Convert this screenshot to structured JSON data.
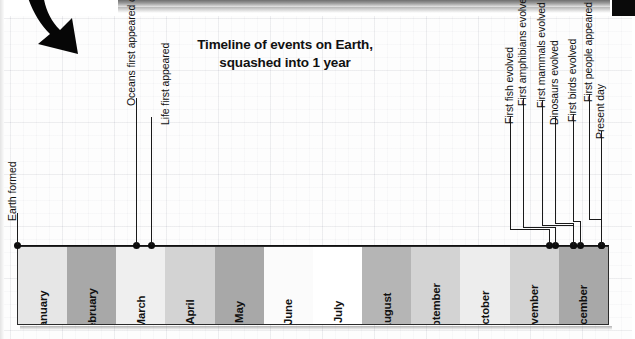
{
  "title": {
    "line1": "Timeline of events on Earth,",
    "line2": "squashed into 1 year"
  },
  "colors": {
    "band_light": "#efefef",
    "band_mid": "#d3d3d3",
    "band_dark": "#a8a8a8",
    "band_white": "#fbfbfb",
    "axis": "#111111",
    "marker": "#0d0d0d"
  },
  "chart_data": {
    "type": "timeline",
    "title": "Timeline of events on Earth, squashed into 1 year",
    "xlabel": "",
    "ylabel": "",
    "axis_range_months": [
      0,
      12
    ],
    "grid": true,
    "legend": "none",
    "categories": [
      "January",
      "February",
      "March",
      "April",
      "May",
      "June",
      "July",
      "August",
      "September",
      "October",
      "November",
      "December"
    ],
    "band_shades": [
      "#e6e6e6",
      "#a8a8a8",
      "#efefef",
      "#d3d3d3",
      "#a8a8a8",
      "#fbfbfb",
      "#ffffff",
      "#b5b5b5",
      "#d3d3d3",
      "#ededed",
      "#d3d3d3",
      "#a8a8a8"
    ],
    "events": [
      {
        "label": "Earth formed",
        "month_value": 0.0
      },
      {
        "label": "Oceans first appeared on Earth",
        "month_value": 2.42
      },
      {
        "label": "Life first appeared",
        "month_value": 2.72
      },
      {
        "label": "First fish evolved",
        "month_value": 10.79
      },
      {
        "label": "First amphibians evolved",
        "month_value": 10.91
      },
      {
        "label": "First mammals evolved",
        "month_value": 11.27
      },
      {
        "label": "Dinosaurs evolved",
        "month_value": 11.41
      },
      {
        "label": "First birds evolved",
        "month_value": 11.68
      },
      {
        "label": "First people appeared on Earth",
        "month_value": 11.98
      },
      {
        "label": "Present day",
        "month_value": 12.0
      }
    ]
  },
  "months": [
    {
      "name": "January",
      "shade": "#e6e6e6"
    },
    {
      "name": "February",
      "shade": "#a8a8a8"
    },
    {
      "name": "March",
      "shade": "#efefef"
    },
    {
      "name": "April",
      "shade": "#d3d3d3"
    },
    {
      "name": "May",
      "shade": "#a8a8a8"
    },
    {
      "name": "June",
      "shade": "#fbfbfb"
    },
    {
      "name": "July",
      "shade": "#ffffff"
    },
    {
      "name": "August",
      "shade": "#b5b5b5"
    },
    {
      "name": "September",
      "shade": "#d3d3d3"
    },
    {
      "name": "October",
      "shade": "#ededed"
    },
    {
      "name": "November",
      "shade": "#d3d3d3"
    },
    {
      "name": "December",
      "shade": "#a8a8a8"
    }
  ],
  "events": [
    {
      "label": "Earth formed",
      "x": 17,
      "label_x": 13,
      "label_y": 236,
      "elbow": 0,
      "stem_top": 213
    },
    {
      "label": "Oceans first appeared on Earth",
      "x": 136,
      "label_x": 132,
      "label_y": 236,
      "elbow": 0,
      "stem_top": 98
    },
    {
      "label": "Life first appeared",
      "x": 151,
      "label_x": 166,
      "label_y": 236,
      "elbow": 151,
      "stem_top": 117
    },
    {
      "label": "First fish evolved",
      "x": 549,
      "label_x": 510,
      "label_y": 236,
      "elbow": 510,
      "stem_top": 116
    },
    {
      "label": "First amphibians evolved",
      "x": 555,
      "label_x": 523,
      "label_y": 236,
      "elbow": 523,
      "stem_top": 98
    },
    {
      "label": "First mammals evolved",
      "x": 573,
      "label_x": 542,
      "label_y": 236,
      "elbow": 542,
      "stem_top": 100
    },
    {
      "label": "Dinosaurs evolved",
      "x": 573,
      "label_x": 555,
      "label_y": 236,
      "elbow": 555,
      "stem_top": 117
    },
    {
      "label": "First birds evolved",
      "x": 580,
      "label_x": 573,
      "label_y": 236,
      "elbow": 573,
      "stem_top": 114
    },
    {
      "label": "First people appeared on Earth",
      "x": 601,
      "label_x": 589,
      "label_y": 236,
      "elbow": 589,
      "stem_top": 94
    },
    {
      "label": "Present day",
      "x": 601,
      "label_x": 601,
      "label_y": 236,
      "elbow": 601,
      "stem_top": 131
    }
  ],
  "arrow": {
    "name": "curved-down-arrow"
  }
}
